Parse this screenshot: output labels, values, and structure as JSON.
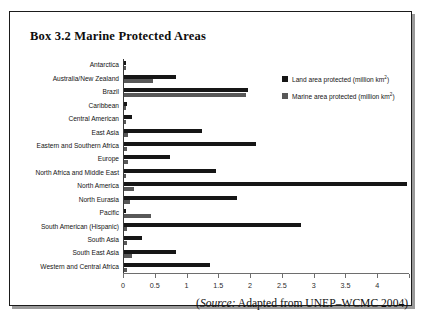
{
  "box": {
    "title": "Box 3.2  Marine Protected Areas"
  },
  "source": {
    "prefix": "(",
    "italic_label": "Source:",
    "text": " Adapted from UNEP–WCMC 2004)"
  },
  "legend": [
    {
      "label": "Land area protected (million km",
      "sup": "2",
      "tail": ")",
      "color": "#161616",
      "name": "legend-land"
    },
    {
      "label": "Marine area protected (million km",
      "sup": "2",
      "tail": ")",
      "color": "#585858",
      "name": "legend-marine"
    }
  ],
  "axis": {
    "ticks": [
      "0",
      "0.5",
      "1",
      "1.5",
      "2",
      "2.5",
      "3",
      "3.5",
      "4",
      ""
    ],
    "min": 0,
    "max": 4.5
  },
  "chart_data": {
    "type": "bar",
    "orientation": "horizontal",
    "title": "Box 3.2  Marine Protected Areas",
    "xlabel": "",
    "ylabel": "",
    "xlim": [
      0,
      4.5
    ],
    "xticks": [
      0,
      0.5,
      1,
      1.5,
      2,
      2.5,
      3,
      3.5,
      4,
      4.5
    ],
    "grid": false,
    "legend_position": "top-right",
    "categories": [
      "Antarctica",
      "Australia/New Zealand",
      "Brazil",
      "Caribbean",
      "Central American",
      "East Asia",
      "Eastern and Southern Africa",
      "Europe",
      "North Africa and Middle East",
      "North America",
      "North Eurasia",
      "Pacific",
      "South American (Hispanic)",
      "South Asia",
      "South East Asia",
      "Western and Central Africa"
    ],
    "series": [
      {
        "name": "Land area protected (million km2)",
        "color": "#161616",
        "values": [
          0.03,
          0.82,
          1.95,
          0.05,
          0.12,
          1.22,
          2.08,
          0.72,
          1.45,
          4.45,
          1.78,
          0.03,
          2.78,
          0.28,
          0.82,
          1.35
        ]
      },
      {
        "name": "Marine area protected (million km2)",
        "color": "#585858",
        "values": [
          0.03,
          0.45,
          1.92,
          0.03,
          0.03,
          0.06,
          0.04,
          0.06,
          0.03,
          0.16,
          0.09,
          0.42,
          0.05,
          0.04,
          0.12,
          0.04
        ]
      }
    ]
  }
}
